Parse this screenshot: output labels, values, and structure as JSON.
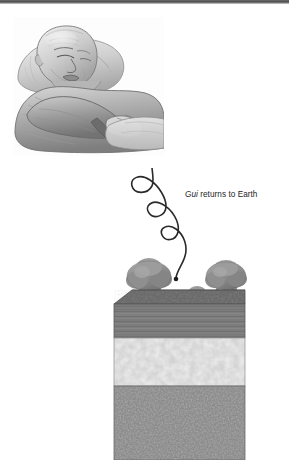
{
  "figure": {
    "kind": "illustration",
    "background_color": "#ffffff",
    "top_rule_color": "#4a4a4a"
  },
  "panels": {
    "bed_scene": {
      "name": "sleeping-man-illustration",
      "description": "Pencil drawing of an elderly bald man lying in bed on a pillow with arms folded across his chest",
      "style": "graphite pencil shading, grayscale",
      "subject": "elderly man",
      "elements": [
        "pillow",
        "blanket",
        "folded arms",
        "hands",
        "head"
      ]
    },
    "earth_scene": {
      "name": "soil-cross-section",
      "description": "Three-dimensional cutaway block of ground showing three soil strata with trees growing on the surface",
      "surface_plants": [
        {
          "type": "tree",
          "size": "large",
          "position": "left"
        },
        {
          "type": "tree",
          "size": "small",
          "position": "center"
        },
        {
          "type": "tree",
          "size": "large",
          "position": "right"
        }
      ],
      "strata": [
        {
          "name": "topsoil",
          "texture": "streaked horizontal lines",
          "color": "#7e7e7e"
        },
        {
          "name": "middle-layer",
          "texture": "mottled light cloudy",
          "color": "#d2d2d2"
        },
        {
          "name": "bedrock",
          "texture": "fine speckled stipple",
          "color": "#8b8b8b"
        }
      ]
    }
  },
  "annotation": {
    "label_full": "Gui returns to Earth",
    "term": "Gui",
    "rest": " returns to Earth",
    "path": {
      "name": "descending-spiral-path",
      "description": "Looping spiral line descending from the upper area down to a point on the ground surface",
      "loop_count": 3,
      "endpoint": "ground surface",
      "stroke_color": "#2a2a2a"
    }
  },
  "colors": {
    "ink": "#1d1d1d",
    "topsoil": "#7e7e7e",
    "topsoil_top_face": "#6a6a6a",
    "middle_layer": "#d2d2d2",
    "bedrock": "#8b8b8b",
    "tree_foliage": "#8a8a8a",
    "tree_trunk": "#707070"
  }
}
